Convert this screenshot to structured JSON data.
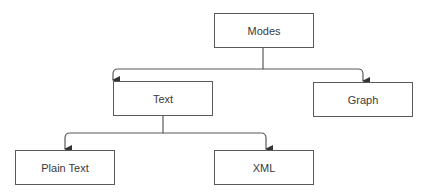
{
  "diagram": {
    "type": "tree",
    "nodes": [
      {
        "id": "modes",
        "label": "Modes",
        "x": 214,
        "y": 13
      },
      {
        "id": "text",
        "label": "Text",
        "x": 113,
        "y": 81
      },
      {
        "id": "graph",
        "label": "Graph",
        "x": 313,
        "y": 82
      },
      {
        "id": "plain_text",
        "label": "Plain Text",
        "x": 15,
        "y": 150
      },
      {
        "id": "xml",
        "label": "XML",
        "x": 214,
        "y": 150
      }
    ],
    "edges": [
      {
        "from": "Modes",
        "to": "Text"
      },
      {
        "from": "Modes",
        "to": "Graph"
      },
      {
        "from": "Text",
        "to": "Plain Text"
      },
      {
        "from": "Text",
        "to": "XML"
      }
    ],
    "colors": {
      "stroke": "#5a5a5a",
      "text": "#3a3a3a",
      "background": "#ffffff"
    }
  }
}
